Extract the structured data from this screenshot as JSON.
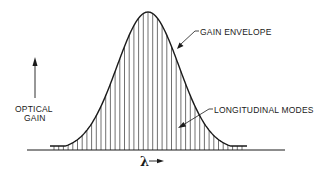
{
  "diagram": {
    "labels": {
      "gain_envelope": "GAIN ENVELOPE",
      "longitudinal_modes": "LONGITUDINAL MODES",
      "y_axis_line1": "OPTICAL",
      "y_axis_line2": "GAIN",
      "x_axis": "λ"
    },
    "colors": {
      "ink": "#1a1a1a",
      "background": "#ffffff"
    },
    "geometry": {
      "baseline_y": 150,
      "baseline_x1": 27,
      "baseline_x2": 285,
      "center_x": 148,
      "peak_y": 12,
      "sigma": 31,
      "curve_x1": 50,
      "curve_x2": 247,
      "mode_spacing": 4.7
    }
  }
}
